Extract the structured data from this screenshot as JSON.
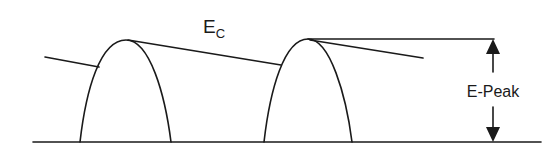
{
  "diagram": {
    "labels": {
      "ec_main": "E",
      "ec_sub": "C",
      "epeak": "E-Peak"
    },
    "colors": {
      "stroke": "#1a1a1a",
      "background": "#ffffff"
    },
    "elements": [
      {
        "type": "baseline",
        "description": "horizontal ground line"
      },
      {
        "type": "arch",
        "description": "left half-sine pulse"
      },
      {
        "type": "arch",
        "description": "right half-sine pulse"
      },
      {
        "type": "decay-line",
        "description": "capacitor discharge line E_C between pulses"
      },
      {
        "type": "dimension-arrow",
        "description": "E-Peak double arrow from baseline to peak level"
      }
    ]
  }
}
